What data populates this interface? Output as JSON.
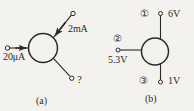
{
  "figure": {
    "background_color": "#f4f2ee",
    "ink_color": "#2a2a28",
    "panels": [
      {
        "id": "a",
        "caption": "(a)",
        "device_shape": "circle",
        "terminals": [
          {
            "name": "left-terminal",
            "label": "20μA",
            "quantity": "current",
            "value": "20",
            "unit": "μA",
            "arrow": true,
            "arrow_direction": "into-device",
            "position": "left"
          },
          {
            "name": "upper-right-terminal",
            "label": "2mA",
            "quantity": "current",
            "value": "2",
            "unit": "mA",
            "arrow": true,
            "arrow_direction": "into-device",
            "position": "upper-right"
          },
          {
            "name": "lower-right-terminal",
            "label": "?",
            "quantity": "current",
            "value": "?",
            "unit": "",
            "arrow": false,
            "arrow_direction": "none",
            "position": "lower-right"
          }
        ]
      },
      {
        "id": "b",
        "caption": "(b)",
        "device_shape": "circle",
        "terminals": [
          {
            "name": "terminal-1",
            "node_marker": "①",
            "label": "6V",
            "quantity": "voltage",
            "value": "6",
            "unit": "V",
            "arrow": false,
            "position": "top"
          },
          {
            "name": "terminal-2",
            "node_marker": "②",
            "label": "5.3V",
            "quantity": "voltage",
            "value": "5.3",
            "unit": "V",
            "arrow": false,
            "position": "left"
          },
          {
            "name": "terminal-3",
            "node_marker": "③",
            "label": "1V",
            "quantity": "voltage",
            "value": "1",
            "unit": "V",
            "arrow": false,
            "position": "bottom"
          }
        ]
      }
    ]
  }
}
